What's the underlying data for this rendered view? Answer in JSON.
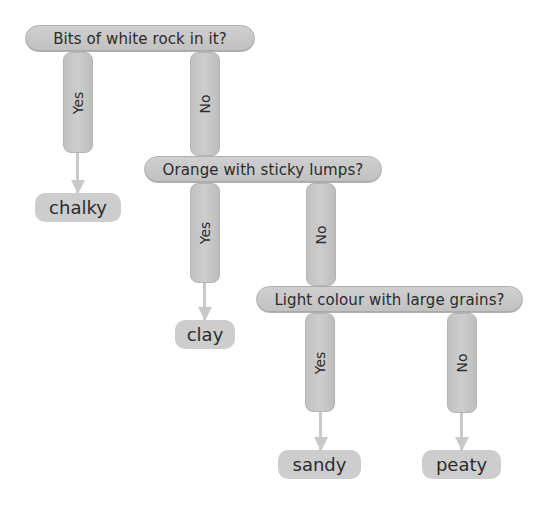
{
  "diagram": {
    "type": "decision-tree",
    "questions": [
      {
        "id": "q1",
        "text": "Bits of white rock in it?",
        "yes": "chalky",
        "no": "q2"
      },
      {
        "id": "q2",
        "text": "Orange with sticky lumps?",
        "yes": "clay",
        "no": "q3"
      },
      {
        "id": "q3",
        "text": "Light colour with large grains?",
        "yes": "sandy",
        "no": "peaty"
      }
    ],
    "branch_labels": {
      "yes": "Yes",
      "no": "No"
    },
    "results": {
      "chalky": "chalky",
      "clay": "clay",
      "sandy": "sandy",
      "peaty": "peaty"
    },
    "colors": {
      "pill_fill": "#c6c6c6",
      "pill_border": "#b0b0b0",
      "arrow": "#c9c9c9",
      "text": "#2b2b2b",
      "background": "#ffffff"
    }
  }
}
